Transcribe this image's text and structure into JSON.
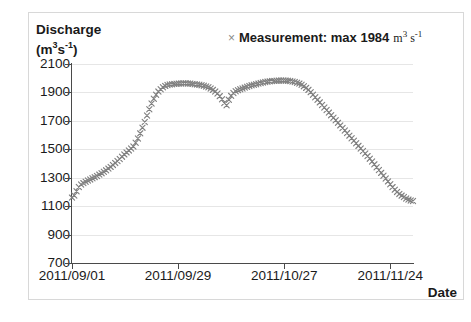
{
  "chart_data": {
    "type": "scatter",
    "title": "",
    "xlabel": "Date",
    "ylabel": "Discharge (m3 s-1)",
    "ylabel_line1": "Discharge",
    "ylabel_line2_prefix": "(m",
    "ylabel_line2_sup1": "3",
    "ylabel_line2_mid": "s",
    "ylabel_line2_sup2": "-1",
    "ylabel_line2_suffix": ")",
    "ylim": [
      700,
      2100
    ],
    "yticks": [
      2100,
      1900,
      1700,
      1500,
      1300,
      1100,
      900,
      700
    ],
    "xticks": [
      "2011/09/01",
      "2011/09/29",
      "2011/10/27",
      "2011/11/24"
    ],
    "xtick_days": [
      0,
      28,
      56,
      84
    ],
    "xlim_days": [
      0,
      90
    ],
    "grid": true,
    "legend_position": "top-right",
    "marker": "x",
    "marker_color": "#808080",
    "axis_color": "#4a4a4a",
    "grid_color": "#e6e6e6",
    "series": [
      {
        "name": "Measurement",
        "max": 1984,
        "x_days": [
          0,
          0.6,
          1.2,
          1.8,
          2.4,
          3,
          3.6,
          4.2,
          4.8,
          5.4,
          6,
          6.6,
          7.2,
          7.8,
          8.4,
          9,
          9.6,
          10.2,
          10.8,
          11.4,
          12,
          12.6,
          13.2,
          13.8,
          14.4,
          15,
          15.6,
          16.2,
          16.8,
          17.4,
          18,
          18.6,
          19.2,
          19.8,
          20.4,
          21,
          21.6,
          22.2,
          22.8,
          23.4,
          24,
          24.6,
          25.2,
          25.8,
          26.4,
          27,
          27.6,
          28.2,
          28.8,
          29.4,
          30,
          30.6,
          31.2,
          31.8,
          32.4,
          33,
          33.6,
          34.2,
          34.8,
          35.4,
          36,
          36.6,
          37.2,
          37.8,
          38.4,
          39,
          39.6,
          40.2,
          40.8,
          41.4,
          42,
          42.6,
          43.2,
          43.8,
          44.4,
          45,
          45.6,
          46.2,
          46.8,
          47.4,
          48,
          48.6,
          49.2,
          49.8,
          50.4,
          51,
          51.6,
          52.2,
          52.8,
          53.4,
          54,
          54.6,
          55.2,
          55.8,
          56.4,
          57,
          57.6,
          58.2,
          58.8,
          59.4,
          60,
          60.6,
          61.2,
          61.8,
          62.4,
          63,
          63.6,
          64.2,
          64.8,
          65.4,
          66,
          66.6,
          67.2,
          67.8,
          68.4,
          69,
          69.6,
          70.2,
          70.8,
          71.4,
          72,
          72.6,
          73.2,
          73.8,
          74.4,
          75,
          75.6,
          76.2,
          76.8,
          77.4,
          78,
          78.6,
          79.2,
          79.8,
          80.4,
          81,
          81.6,
          82.2,
          82.8,
          83.4,
          84,
          84.6,
          85.2,
          85.8,
          86.4,
          87,
          87.6,
          88.2,
          88.8,
          89.4,
          90
        ],
        "values": [
          1160,
          1175,
          1205,
          1235,
          1252,
          1262,
          1272,
          1280,
          1288,
          1296,
          1304,
          1312,
          1322,
          1332,
          1342,
          1352,
          1364,
          1376,
          1390,
          1404,
          1418,
          1432,
          1448,
          1464,
          1478,
          1492,
          1506,
          1520,
          1546,
          1576,
          1612,
          1652,
          1692,
          1738,
          1782,
          1822,
          1856,
          1884,
          1906,
          1922,
          1936,
          1946,
          1952,
          1956,
          1958,
          1960,
          1961,
          1962,
          1963,
          1964,
          1964,
          1963,
          1962,
          1960,
          1958,
          1956,
          1954,
          1951,
          1947,
          1942,
          1936,
          1928,
          1918,
          1906,
          1892,
          1874,
          1852,
          1826,
          1810,
          1848,
          1876,
          1896,
          1908,
          1916,
          1922,
          1928,
          1934,
          1940,
          1945,
          1950,
          1954,
          1958,
          1962,
          1966,
          1970,
          1973,
          1976,
          1978,
          1980,
          1981,
          1982,
          1983,
          1984,
          1984,
          1983,
          1982,
          1980,
          1977,
          1973,
          1968,
          1962,
          1954,
          1944,
          1932,
          1918,
          1902,
          1884,
          1866,
          1848,
          1830,
          1812,
          1794,
          1776,
          1758,
          1740,
          1722,
          1704,
          1686,
          1668,
          1650,
          1632,
          1614,
          1596,
          1578,
          1560,
          1542,
          1524,
          1506,
          1488,
          1470,
          1452,
          1434,
          1414,
          1394,
          1374,
          1354,
          1334,
          1314,
          1294,
          1274,
          1254,
          1234,
          1216,
          1200,
          1186,
          1174,
          1164,
          1154,
          1146,
          1140,
          1136,
          1132
        ]
      }
    ]
  },
  "legend": {
    "marker": "×",
    "label": "Measurement: max 1984",
    "unit_prefix": "m",
    "unit_sup1": "3",
    "unit_mid": "s",
    "unit_sup2": "-1"
  },
  "axes": {
    "x_title": "Date"
  }
}
